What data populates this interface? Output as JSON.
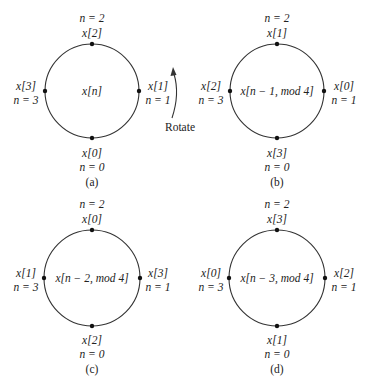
{
  "colors": {
    "background": "#ffffff",
    "stroke": "#333333",
    "text": "#222222"
  },
  "rotate_label": "Rotate",
  "panels": [
    {
      "id": "a",
      "caption": "(a)",
      "center_label": "x[n]",
      "top": {
        "n_label": "n = 2",
        "x_label": "x[2]"
      },
      "right": {
        "x_label": "x[1]",
        "n_label": "n = 1"
      },
      "bottom": {
        "x_label": "x[0]",
        "n_label": "n = 0"
      },
      "left": {
        "x_label": "x[3]",
        "n_label": "n = 3"
      }
    },
    {
      "id": "b",
      "caption": "(b)",
      "center_label": "x[n − 1, mod 4]",
      "top": {
        "n_label": "n = 2",
        "x_label": "x[1]"
      },
      "right": {
        "x_label": "x[0]",
        "n_label": "n = 1"
      },
      "bottom": {
        "x_label": "x[3]",
        "n_label": "n = 0"
      },
      "left": {
        "x_label": "x[2]",
        "n_label": "n = 3"
      }
    },
    {
      "id": "c",
      "caption": "(c)",
      "center_label": "x[n − 2, mod 4]",
      "top": {
        "n_label": "n = 2",
        "x_label": "x[0]"
      },
      "right": {
        "x_label": "x[3]",
        "n_label": "n = 1"
      },
      "bottom": {
        "x_label": "x[2]",
        "n_label": "n = 0"
      },
      "left": {
        "x_label": "x[1]",
        "n_label": "n = 3"
      }
    },
    {
      "id": "d",
      "caption": "(d)",
      "center_label": "x[n − 3, mod 4]",
      "top": {
        "n_label": "n = 2",
        "x_label": "x[3]"
      },
      "right": {
        "x_label": "x[2]",
        "n_label": "n = 1"
      },
      "bottom": {
        "x_label": "x[1]",
        "n_label": "n = 0"
      },
      "left": {
        "x_label": "x[0]",
        "n_label": "n = 3"
      }
    }
  ]
}
